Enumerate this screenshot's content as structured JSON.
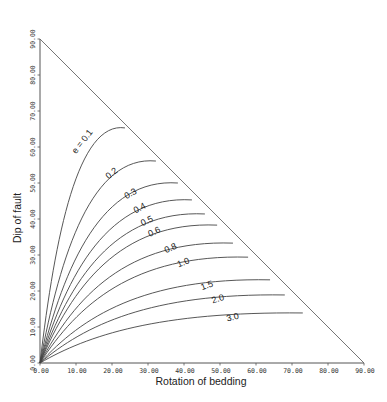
{
  "chart_data": {
    "type": "line",
    "title": "",
    "xlabel": "Rotation of bedding",
    "ylabel": "Dip of fault",
    "xlim": [
      0,
      90
    ],
    "ylim": [
      0,
      90
    ],
    "grid": false,
    "legend": "inline curve labels",
    "x_ticks": [
      "0.00",
      "10.00",
      "20.00",
      "30.00",
      "40.00",
      "50.00",
      "60.00",
      "70.00",
      "80.00",
      "90.00"
    ],
    "y_ticks": [
      "0.00",
      "10.00",
      "20.00",
      "30.00",
      "40.00",
      "50.00",
      "60.00",
      "70.00",
      "80.00",
      "90.00"
    ],
    "boundary": {
      "description": "diagonal line from (0,90) to (90,0)"
    },
    "series": [
      {
        "name": "e = 0.1",
        "label": "e = 0.1",
        "end": [
          23.6,
          65.3
        ],
        "start": [
          0,
          0
        ],
        "label_pos": [
          10,
          58
        ],
        "label_angle": -52
      },
      {
        "name": "0.2",
        "label": "0.2",
        "end": [
          32.2,
          56.1
        ],
        "start": [
          0,
          0
        ],
        "label_pos": [
          19,
          51
        ],
        "label_angle": -38
      },
      {
        "name": "0.3",
        "label": "0.3",
        "end": [
          38.3,
          50.0
        ],
        "start": [
          0,
          0
        ],
        "label_pos": [
          24,
          45.5
        ],
        "label_angle": -30
      },
      {
        "name": "0.4",
        "label": "0.4",
        "end": [
          42.2,
          45.3
        ],
        "start": [
          0,
          0
        ],
        "label_pos": [
          26.5,
          41.5
        ],
        "label_angle": -28
      },
      {
        "name": "0.5",
        "label": "0.5",
        "end": [
          45.8,
          41.4
        ],
        "start": [
          0,
          0
        ],
        "label_pos": [
          28.5,
          38
        ],
        "label_angle": -26
      },
      {
        "name": "0.6",
        "label": "0.6",
        "end": [
          49.2,
          38.3
        ],
        "start": [
          0,
          0
        ],
        "label_pos": [
          30.5,
          35
        ],
        "label_angle": -25
      },
      {
        "name": "0.8",
        "label": "0.8",
        "end": [
          53.6,
          33.3
        ],
        "start": [
          0,
          0
        ],
        "label_pos": [
          35,
          30.5
        ],
        "label_angle": -24
      },
      {
        "name": "1.0",
        "label": "1.0",
        "end": [
          57.8,
          29.4
        ],
        "start": [
          0,
          0
        ],
        "label_pos": [
          38.5,
          26.5
        ],
        "label_angle": -22
      },
      {
        "name": "1.5",
        "label": "1.5",
        "end": [
          63.9,
          23.1
        ],
        "start": [
          0,
          0
        ],
        "label_pos": [
          45,
          20.2
        ],
        "label_angle": -20
      },
      {
        "name": "2.0",
        "label": "2.0",
        "end": [
          68.0,
          18.9
        ],
        "start": [
          0,
          0
        ],
        "label_pos": [
          48,
          16.5
        ],
        "label_angle": -18
      },
      {
        "name": "3.0",
        "label": "3.0",
        "end": [
          73.0,
          13.9
        ],
        "start": [
          0,
          0
        ],
        "label_pos": [
          52,
          11.5
        ],
        "label_angle": -14
      }
    ]
  },
  "layout": {
    "origin_px": [
      40,
      363
    ],
    "px_per_unit": 3.6
  }
}
